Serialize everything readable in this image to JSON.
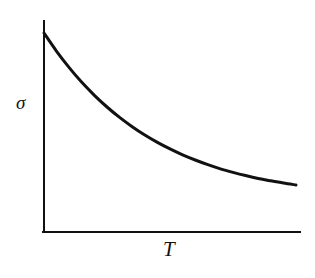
{
  "figure": {
    "background_color": "#ffffff",
    "ink_color": "#111111"
  },
  "axes": {
    "y_label": "σ",
    "x_label": "T",
    "y_label_name": "sigma",
    "x_label_name": "T"
  },
  "chart_data": {
    "type": "line",
    "title": "",
    "subtitle": "",
    "xlabel": "T",
    "ylabel": "σ",
    "grid": false,
    "legend": false,
    "legend_position": "none",
    "axis_ticks": false,
    "tick_labels": [],
    "xlim": [
      0,
      1
    ],
    "ylim": [
      0,
      1
    ],
    "series": [
      {
        "name": "σ(T)",
        "color": "#111111",
        "line_width": 3,
        "x": [
          0.0,
          0.05,
          0.1,
          0.15,
          0.2,
          0.25,
          0.3,
          0.35,
          0.4,
          0.45,
          0.5,
          0.55,
          0.6,
          0.65,
          0.7,
          0.75,
          0.8,
          0.85,
          0.9,
          0.95,
          1.0
        ],
        "y": [
          1.0,
          0.886,
          0.784,
          0.692,
          0.611,
          0.538,
          0.473,
          0.415,
          0.363,
          0.317,
          0.276,
          0.239,
          0.207,
          0.178,
          0.152,
          0.13,
          0.11,
          0.092,
          0.077,
          0.063,
          0.051
        ]
      }
    ],
    "annotations": [],
    "model": "sigma(T) = sigma_inf + (sigma_0 - sigma_inf) * exp(-T / tau)"
  },
  "geometry": {
    "y_axis_x": 44,
    "y_axis_top": 21,
    "origin_x": 44,
    "origin_y": 232,
    "x_axis_right": 300,
    "curve_start": [
      44,
      33
    ],
    "curve_end": [
      296,
      185
    ],
    "curve_asymptote_y": 185,
    "axis_stroke_width": 2,
    "curve_stroke_width": 3
  }
}
